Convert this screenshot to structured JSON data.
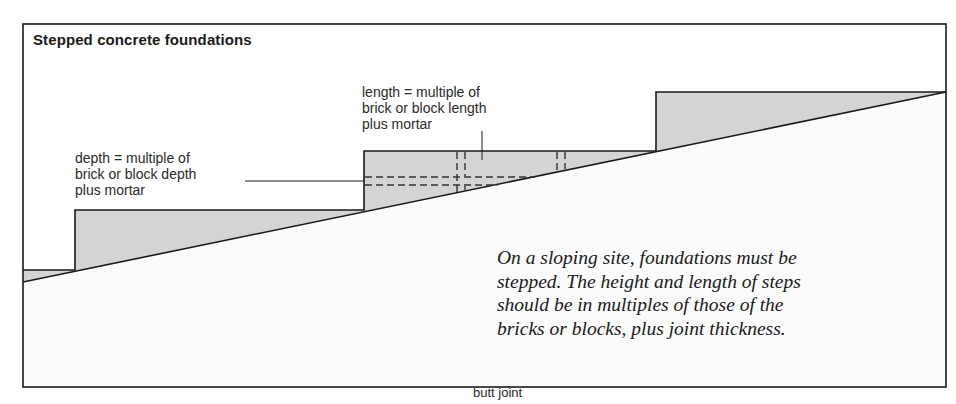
{
  "figure": {
    "title": "Stepped concrete foundations",
    "labels": {
      "depth": [
        "depth = multiple of",
        "brick or block depth",
        "plus mortar"
      ],
      "length": [
        "length = multiple of",
        "brick or block length",
        "plus mortar"
      ]
    },
    "note": [
      "On a sloping site, foundations must be",
      "stepped. The height and length of steps",
      "should be in multiples of those of the",
      "bricks or blocks, plus joint thickness."
    ],
    "caption": "butt joint",
    "colors": {
      "frame": "#1a1a1a",
      "concrete_fill": "#d4d4d4",
      "ground_fill": "#fbfbfb",
      "background": "#ffffff"
    }
  }
}
